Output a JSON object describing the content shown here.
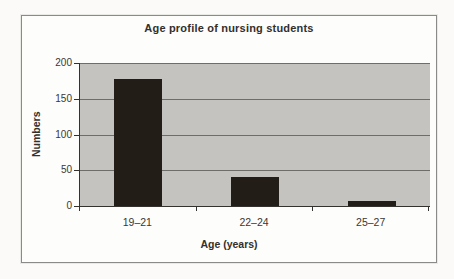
{
  "chart_data": {
    "type": "bar",
    "title": "Age profile of nursing students",
    "xlabel": "Age (years)",
    "ylabel": "Numbers",
    "categories": [
      "19–21",
      "22–24",
      "25–27"
    ],
    "values": [
      178,
      40,
      7
    ],
    "ylim": [
      0,
      200
    ],
    "yticks": [
      "200",
      "150",
      "100",
      "50",
      "0"
    ],
    "grid": true,
    "legend": false,
    "colors": {
      "bar": "#221d17",
      "plot_bg": "#c4c3c0",
      "grid": "#6e6d6a",
      "axis": "#33322f",
      "text": "#32302c"
    }
  }
}
